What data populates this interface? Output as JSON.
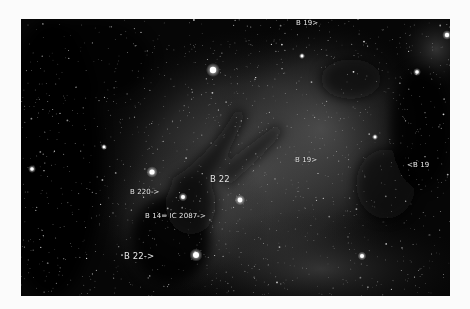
{
  "image": {
    "subject": "dark nebulae starfield",
    "frame": {
      "background": "#fbfbfb",
      "photo_bg": "#060606"
    }
  },
  "labels": [
    {
      "id": "b19-top",
      "text": "B 19>",
      "x": 275,
      "y": 0,
      "size": "small"
    },
    {
      "id": "b19-center",
      "text": "B 19>",
      "x": 274,
      "y": 137,
      "size": "small"
    },
    {
      "id": "b19-right",
      "text": "<B 19",
      "x": 386,
      "y": 142,
      "size": "small"
    },
    {
      "id": "b22-upper",
      "text": "B 22",
      "x": 189,
      "y": 155,
      "size": "big"
    },
    {
      "id": "b220",
      "text": "B 220->",
      "x": 109,
      "y": 169,
      "size": "small"
    },
    {
      "id": "b14-ic2087",
      "text": "B 14= IC 2087->",
      "x": 124,
      "y": 193,
      "size": "small"
    },
    {
      "id": "b22-lower",
      "text": "B 22->",
      "x": 103,
      "y": 232,
      "size": "big"
    }
  ],
  "bright_stars": [
    {
      "x": 213,
      "y": 70,
      "r": 3.2
    },
    {
      "x": 152,
      "y": 172,
      "r": 2.6
    },
    {
      "x": 240,
      "y": 200,
      "r": 2.4
    },
    {
      "x": 196,
      "y": 255,
      "r": 3.0
    },
    {
      "x": 183,
      "y": 197,
      "r": 2.0
    },
    {
      "x": 362,
      "y": 256,
      "r": 2.0
    },
    {
      "x": 447,
      "y": 35,
      "r": 2.2
    },
    {
      "x": 32,
      "y": 169,
      "r": 1.8
    },
    {
      "x": 104,
      "y": 147,
      "r": 1.4
    },
    {
      "x": 417,
      "y": 72,
      "r": 1.8
    },
    {
      "x": 375,
      "y": 137,
      "r": 1.4
    },
    {
      "x": 302,
      "y": 56,
      "r": 1.4
    },
    {
      "x": 424,
      "y": 6,
      "r": 1.8
    }
  ]
}
